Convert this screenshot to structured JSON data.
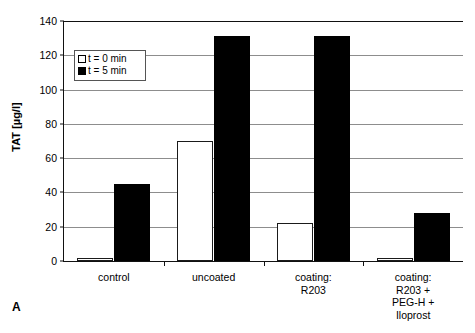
{
  "figure": {
    "panel_label": "A"
  },
  "legend": {
    "position": "inside-top-left",
    "entries": [
      {
        "label": "t = 0 min",
        "marker": "open-square",
        "color": "#ffffff"
      },
      {
        "label": "t = 5 min",
        "marker": "filled-square",
        "color": "#000000"
      }
    ]
  },
  "chart_data": {
    "type": "bar",
    "title": "",
    "xlabel": "",
    "ylabel": "TAT [µg/l]",
    "ylim": [
      0,
      140
    ],
    "yticks": [
      0,
      20,
      40,
      60,
      80,
      100,
      120,
      140
    ],
    "ytick_labels": [
      "0",
      "20",
      "40",
      "60",
      "80",
      "100",
      "120",
      "140"
    ],
    "grid": true,
    "grid_axis": "y",
    "legend_position": "upper left",
    "categories": [
      "control",
      "uncoated",
      "coating:\nR203",
      "coating:\nR203 +\nPEG-H +\nIloprost"
    ],
    "category_lines": [
      [
        "control"
      ],
      [
        "uncoated"
      ],
      [
        "coating:",
        "R203"
      ],
      [
        "coating:",
        "R203 +",
        "PEG-H +",
        "Iloprost"
      ]
    ],
    "series": [
      {
        "name": "t = 0 min",
        "color": "#ffffff",
        "values": [
          2,
          70,
          22,
          2
        ]
      },
      {
        "name": "t = 5 min",
        "color": "#000000",
        "values": [
          45,
          131,
          131,
          28
        ]
      }
    ]
  }
}
